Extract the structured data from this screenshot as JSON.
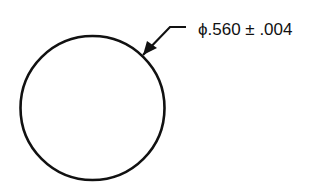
{
  "diagram": {
    "type": "engineering-drawing",
    "shape": "circle",
    "dimension": {
      "symbol": "ϕ",
      "nominal": ".560",
      "tolerance_symbol": "±",
      "tolerance": ".004",
      "label": "ϕ.560 ± .004"
    },
    "colors": {
      "line": "#111111",
      "background": "#ffffff"
    }
  }
}
